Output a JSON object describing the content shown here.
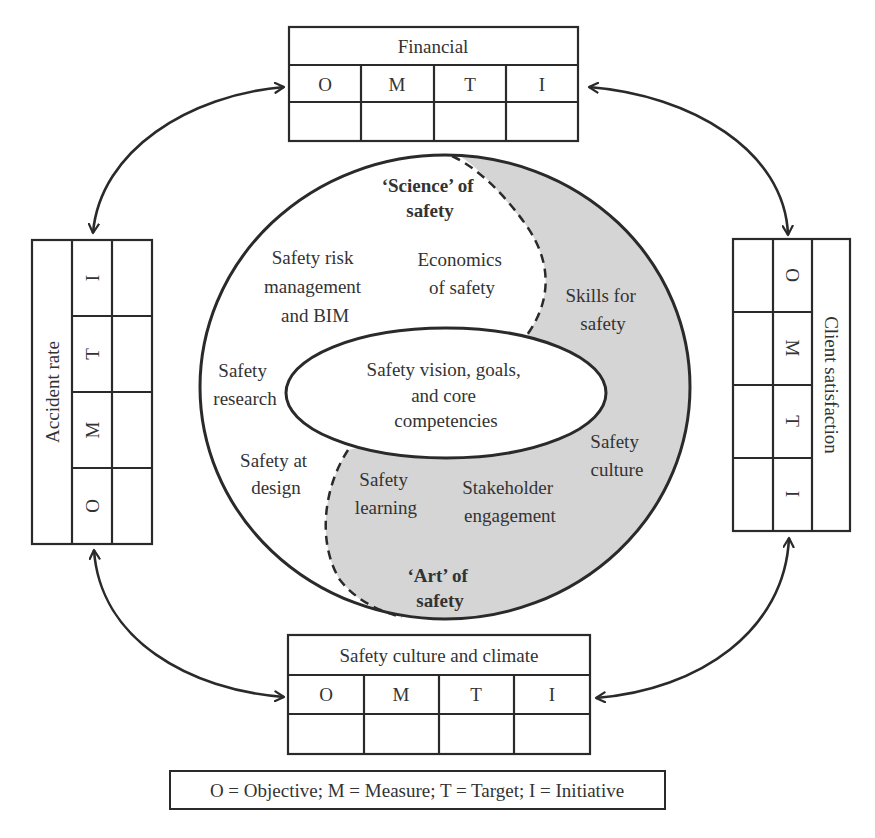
{
  "colors": {
    "line": "#2a2a2a",
    "art_fill": "#d5d5d5",
    "background": "#ffffff",
    "text": "#333333"
  },
  "scorecards": {
    "top": {
      "title": "Financial",
      "columns": [
        "O",
        "M",
        "T",
        "I"
      ]
    },
    "left": {
      "title": "Accident rate",
      "columns": [
        "O",
        "M",
        "T",
        "I"
      ]
    },
    "right": {
      "title": "Client satisfaction",
      "columns": [
        "O",
        "M",
        "T",
        "I"
      ]
    },
    "bottom": {
      "title": "Safety culture and climate",
      "columns": [
        "O",
        "M",
        "T",
        "I"
      ]
    }
  },
  "core": {
    "center_lines": [
      "Safety vision, goals,",
      "and core",
      "competencies"
    ],
    "science_heading": [
      "‘Science’ of",
      "safety"
    ],
    "art_heading": [
      "‘Art’ of",
      "safety"
    ],
    "science_items": {
      "risk": [
        "Safety risk",
        "management",
        "and BIM"
      ],
      "economics": [
        "Economics",
        "of safety"
      ],
      "research": [
        "Safety",
        "research"
      ],
      "design": [
        "Safety at",
        "design"
      ]
    },
    "art_items": {
      "skills": [
        "Skills for",
        "safety"
      ],
      "culture": [
        "Safety",
        "culture"
      ],
      "learning": [
        "Safety",
        "learning"
      ],
      "stakeholder": [
        "Stakeholder",
        "engagement"
      ]
    }
  },
  "legend": {
    "text": "O = Objective; M = Measure; T = Target; I = Initiative"
  }
}
